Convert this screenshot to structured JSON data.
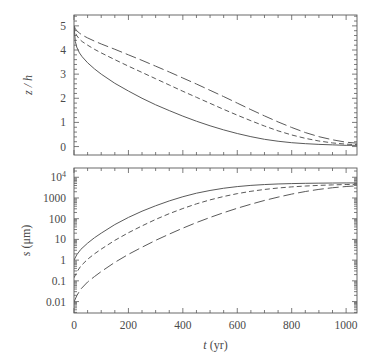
{
  "figure": {
    "background": "#ffffff",
    "ink_color": "#5a5a5a",
    "text_color": "#4a4a4a"
  },
  "axes": {
    "x": {
      "label_var": "t",
      "label_unit": "(yr)",
      "label_full": "t (yr)",
      "min": 0,
      "max": 1040,
      "ticks": [
        0,
        200,
        400,
        600,
        800,
        1000
      ],
      "tick_labels": [
        "0",
        "200",
        "400",
        "600",
        "800",
        "1000"
      ],
      "minor_step": 50,
      "scale": "linear"
    },
    "y_top": {
      "label_full": "z / h",
      "label_num": "z",
      "label_den": "h",
      "min": -0.35,
      "max": 5.45,
      "ticks": [
        0,
        1,
        2,
        3,
        4,
        5
      ],
      "tick_labels": [
        "0",
        "1",
        "2",
        "3",
        "4",
        "5"
      ],
      "minor_step": 0.2,
      "scale": "linear"
    },
    "y_bottom": {
      "label_var": "s",
      "label_unit": "(μm)",
      "label_full": "s (μm)",
      "min_exp": -2.55,
      "max_exp": 4.45,
      "ticks": [
        0.01,
        0.1,
        1,
        10,
        100,
        1000,
        10000
      ],
      "tick_labels": [
        "0.01",
        "0.1",
        "1",
        "10",
        "100",
        "1000",
        "10"
      ],
      "top_tick_exponent": "4",
      "scale": "log"
    }
  },
  "chart_data": {
    "type": "line",
    "title": "",
    "subtitle": "",
    "panels": [
      {
        "id": "top-panel",
        "xlabel": "",
        "ylabel": "z / h",
        "xlim": [
          0,
          1040
        ],
        "ylim": [
          -0.35,
          5.45
        ],
        "yscale": "linear",
        "grid": false,
        "legend": "none",
        "x": [
          0,
          5,
          10,
          20,
          30,
          50,
          75,
          100,
          150,
          200,
          250,
          300,
          350,
          400,
          450,
          500,
          550,
          600,
          650,
          700,
          750,
          800,
          850,
          900,
          950,
          1000,
          1040
        ],
        "series": [
          {
            "name": "curve-solid",
            "style": "solid",
            "values": [
              4.97,
              4.35,
              4.12,
              3.88,
              3.72,
              3.47,
              3.22,
              3.0,
              2.62,
              2.3,
              2.0,
              1.73,
              1.49,
              1.26,
              1.05,
              0.86,
              0.69,
              0.54,
              0.41,
              0.3,
              0.22,
              0.16,
              0.12,
              0.09,
              0.07,
              0.05,
              0.05
            ]
          },
          {
            "name": "curve-dashed",
            "style": "dashed",
            "values": [
              4.99,
              4.72,
              4.6,
              4.45,
              4.35,
              4.2,
              4.03,
              3.88,
              3.6,
              3.33,
              3.07,
              2.81,
              2.55,
              2.29,
              2.04,
              1.79,
              1.54,
              1.3,
              1.07,
              0.85,
              0.65,
              0.48,
              0.34,
              0.23,
              0.15,
              0.1,
              0.08
            ]
          },
          {
            "name": "curve-dashdot",
            "style": "dashdot",
            "values": [
              5.0,
              4.88,
              4.8,
              4.7,
              4.62,
              4.5,
              4.37,
              4.25,
              4.03,
              3.8,
              3.57,
              3.33,
              3.09,
              2.84,
              2.59,
              2.33,
              2.07,
              1.8,
              1.53,
              1.27,
              1.02,
              0.79,
              0.58,
              0.41,
              0.28,
              0.18,
              0.14
            ]
          }
        ]
      },
      {
        "id": "bottom-panel",
        "xlabel": "t (yr)",
        "ylabel": "s (μm)",
        "xlim": [
          0,
          1040
        ],
        "ylim": [
          0.0028,
          28000
        ],
        "yscale": "log",
        "grid": false,
        "legend": "none",
        "x": [
          0,
          10,
          25,
          50,
          75,
          100,
          150,
          200,
          250,
          300,
          350,
          400,
          450,
          500,
          550,
          600,
          650,
          700,
          750,
          800,
          850,
          900,
          950,
          1000,
          1040
        ],
        "series": [
          {
            "name": "curve-solid",
            "style": "solid",
            "values": [
              1.0,
              1.8,
              3.3,
              6.6,
              12.0,
              20.0,
              52.0,
              115.0,
              230.0,
              420.0,
              720.0,
              1150.0,
              1700.0,
              2300.0,
              2950.0,
              3550.0,
              4050.0,
              4450.0,
              4750.0,
              4950.0,
              5100.0,
              5200.0,
              5270.0,
              5320.0,
              5340.0
            ]
          },
          {
            "name": "curve-dashed",
            "style": "dashed",
            "values": [
              0.14,
              0.26,
              0.52,
              1.1,
              2.0,
              3.4,
              9.0,
              21.0,
              45.0,
              92.0,
              175.0,
              310.0,
              520.0,
              810.0,
              1180.0,
              1620.0,
              2100.0,
              2580.0,
              3030.0,
              3430.0,
              3770.0,
              4050.0,
              4280.0,
              4460.0,
              4560.0
            ]
          },
          {
            "name": "curve-dashdot",
            "style": "dashdot",
            "values": [
              0.0095,
              0.019,
              0.04,
              0.088,
              0.16,
              0.28,
              0.78,
              1.9,
              4.2,
              9.0,
              18.0,
              35.0,
              65.0,
              115.0,
              195.0,
              320.0,
              500.0,
              760.0,
              1100.0,
              1540.0,
              2050.0,
              2600.0,
              3120.0,
              3580.0,
              3860.0
            ]
          }
        ]
      }
    ]
  }
}
